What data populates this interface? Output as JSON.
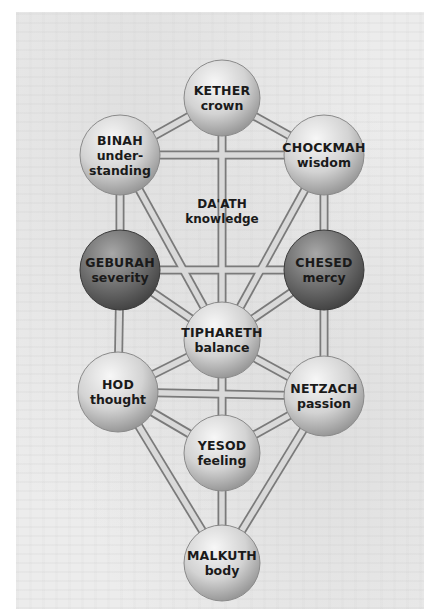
{
  "diagram": {
    "type": "Tree of Life (Kabbalah Sephirot)",
    "colors": {
      "light_sphere": "#d6d6d6",
      "dark_sphere": "#6e6e6e",
      "path_fill": "#d9d9d9",
      "path_outline": "#7a7a7a",
      "text": "#1a1a1a",
      "background": "#ececec"
    },
    "nodes": [
      {
        "id": "kether",
        "name": "KETHER",
        "meaning": "crown",
        "shade": "light",
        "x": 222,
        "y": 98,
        "r": 38
      },
      {
        "id": "binah",
        "name": "BINAH",
        "meaning": "under-\nstanding",
        "meaning_lines": [
          "under-",
          "standing"
        ],
        "shade": "light",
        "x": 120,
        "y": 155,
        "r": 40
      },
      {
        "id": "chockmah",
        "name": "CHOCKMAH",
        "meaning": "wisdom",
        "shade": "light",
        "x": 324,
        "y": 155,
        "r": 40
      },
      {
        "id": "geburah",
        "name": "GEBURAH",
        "meaning": "severity",
        "shade": "dark",
        "x": 120,
        "y": 270,
        "r": 40
      },
      {
        "id": "chesed",
        "name": "CHESED",
        "meaning": "mercy",
        "shade": "dark",
        "x": 324,
        "y": 270,
        "r": 40
      },
      {
        "id": "tiphareth",
        "name": "TIPHARETH",
        "meaning": "balance",
        "shade": "light",
        "x": 222,
        "y": 340,
        "r": 38
      },
      {
        "id": "hod",
        "name": "HOD",
        "meaning": "thought",
        "shade": "light",
        "x": 118,
        "y": 392,
        "r": 40
      },
      {
        "id": "netzach",
        "name": "NETZACH",
        "meaning": "passion",
        "shade": "light",
        "x": 324,
        "y": 396,
        "r": 40
      },
      {
        "id": "yesod",
        "name": "YESOD",
        "meaning": "feeling",
        "shade": "light",
        "x": 222,
        "y": 453,
        "r": 38
      },
      {
        "id": "malkuth",
        "name": "MALKUTH",
        "meaning": "body",
        "shade": "light",
        "x": 222,
        "y": 563,
        "r": 38
      }
    ],
    "daath": {
      "name": "DA'ATH",
      "meaning": "knowledge",
      "x": 222,
      "y": 212
    },
    "paths": [
      [
        "kether",
        "binah"
      ],
      [
        "kether",
        "chockmah"
      ],
      [
        "kether",
        "tiphareth"
      ],
      [
        "binah",
        "chockmah"
      ],
      [
        "binah",
        "geburah"
      ],
      [
        "binah",
        "tiphareth"
      ],
      [
        "chockmah",
        "chesed"
      ],
      [
        "chockmah",
        "tiphareth"
      ],
      [
        "geburah",
        "chesed"
      ],
      [
        "geburah",
        "tiphareth"
      ],
      [
        "geburah",
        "hod"
      ],
      [
        "chesed",
        "tiphareth"
      ],
      [
        "chesed",
        "netzach"
      ],
      [
        "tiphareth",
        "hod"
      ],
      [
        "tiphareth",
        "netzach"
      ],
      [
        "tiphareth",
        "yesod"
      ],
      [
        "hod",
        "netzach"
      ],
      [
        "hod",
        "yesod"
      ],
      [
        "hod",
        "malkuth"
      ],
      [
        "netzach",
        "yesod"
      ],
      [
        "netzach",
        "malkuth"
      ],
      [
        "yesod",
        "malkuth"
      ]
    ]
  }
}
